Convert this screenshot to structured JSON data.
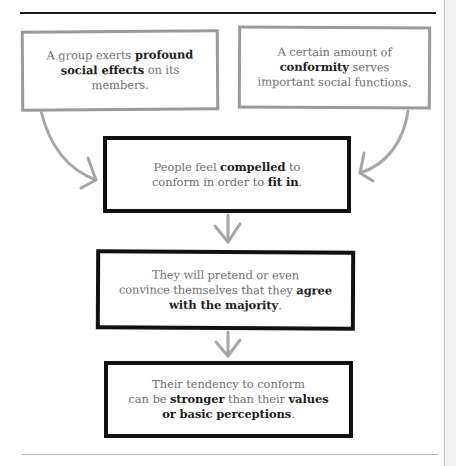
{
  "diagram": {
    "type": "flowchart",
    "colors": {
      "top_rule": "#1a1a1a",
      "bottom_rule": "#b9b9b9",
      "gray_border": "#9a9a9a",
      "black_border": "#111111",
      "arrow": "#a6a6a6",
      "regular_text": "#707070",
      "bold_text": "#1e1e1e"
    },
    "boxes": [
      {
        "id": "box1",
        "style": "gray",
        "segments": [
          {
            "text": "A group exerts ",
            "bold": false
          },
          {
            "text": "profound",
            "bold": true
          },
          {
            "text": "\n",
            "bold": false
          },
          {
            "text": "social effects",
            "bold": true
          },
          {
            "text": " on its",
            "bold": false
          },
          {
            "text": "\n",
            "bold": false
          },
          {
            "text": "members.",
            "bold": false
          }
        ]
      },
      {
        "id": "box2",
        "style": "gray",
        "segments": [
          {
            "text": "A certain amount of",
            "bold": false
          },
          {
            "text": "\n",
            "bold": false
          },
          {
            "text": "conformity",
            "bold": true
          },
          {
            "text": " serves",
            "bold": false
          },
          {
            "text": "\n",
            "bold": false
          },
          {
            "text": "important social functions.",
            "bold": false
          }
        ]
      },
      {
        "id": "box3",
        "style": "black",
        "segments": [
          {
            "text": "People feel ",
            "bold": false
          },
          {
            "text": "compelled",
            "bold": true
          },
          {
            "text": " to",
            "bold": false
          },
          {
            "text": "\n",
            "bold": false
          },
          {
            "text": "conform in order to ",
            "bold": false
          },
          {
            "text": "fit in",
            "bold": true
          },
          {
            "text": ".",
            "bold": false
          }
        ]
      },
      {
        "id": "box4",
        "style": "black",
        "segments": [
          {
            "text": "They will pretend or even",
            "bold": false
          },
          {
            "text": "\n",
            "bold": false
          },
          {
            "text": "convince themselves that they ",
            "bold": false
          },
          {
            "text": "agree",
            "bold": true
          },
          {
            "text": "\n",
            "bold": false
          },
          {
            "text": "with the majority",
            "bold": true
          },
          {
            "text": ".",
            "bold": false
          }
        ]
      },
      {
        "id": "box5",
        "style": "black",
        "segments": [
          {
            "text": "Their tendency to conform",
            "bold": false
          },
          {
            "text": "\n",
            "bold": false
          },
          {
            "text": "can be ",
            "bold": false
          },
          {
            "text": "stronger",
            "bold": true
          },
          {
            "text": " than their ",
            "bold": false
          },
          {
            "text": "values",
            "bold": true
          },
          {
            "text": "\n",
            "bold": false
          },
          {
            "text": "or basic perceptions",
            "bold": true
          },
          {
            "text": ".",
            "bold": false
          }
        ]
      }
    ],
    "connectors": [
      {
        "from": "box1",
        "to": "box3",
        "kind": "curved-arrow"
      },
      {
        "from": "box2",
        "to": "box3",
        "kind": "curved-arrow"
      },
      {
        "from": "box3",
        "to": "box4",
        "kind": "down-arrow"
      },
      {
        "from": "box4",
        "to": "box5",
        "kind": "down-arrow"
      }
    ]
  }
}
